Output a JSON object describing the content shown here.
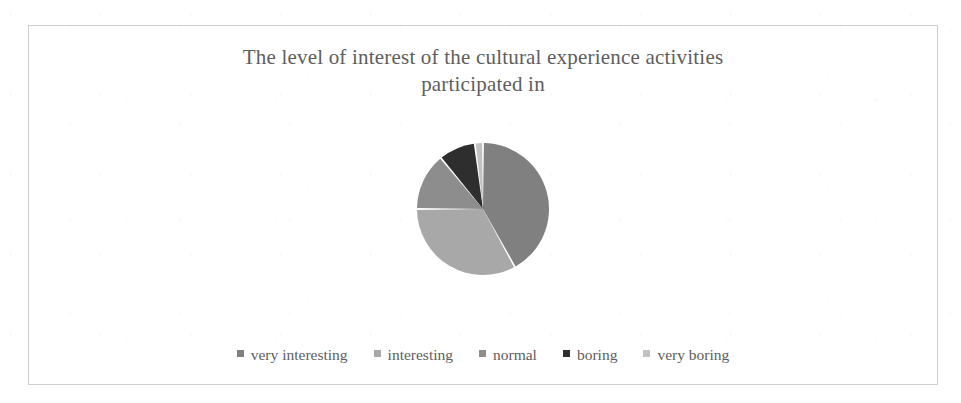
{
  "figure": {
    "title_line1": "The level of interest of the cultural experience activities",
    "title_line2": "participated in",
    "border_color": "#cfcfcf",
    "text_color": "#5e5e5e"
  },
  "legend": {
    "position": "bottom",
    "items": [
      {
        "label": "very interesting",
        "color": "#808080",
        "marker": "square-marker"
      },
      {
        "label": "interesting",
        "color": "#a8a8a8",
        "marker": "square-marker"
      },
      {
        "label": "normal",
        "color": "#8d8d8d",
        "marker": "square-marker"
      },
      {
        "label": "boring",
        "color": "#2e2e2e",
        "marker": "square-marker"
      },
      {
        "label": "very boring",
        "color": "#c2c2c2",
        "marker": "square-marker"
      }
    ]
  },
  "chart_data": {
    "type": "pie",
    "title": "The level of interest of the cultural experience activities participated in",
    "xlabel": "",
    "ylabel": "",
    "legend_position": "bottom",
    "grid": false,
    "start_angle_deg": 0,
    "direction": "clockwise",
    "categories": [
      "very interesting",
      "interesting",
      "normal",
      "boring",
      "very boring"
    ],
    "values": [
      42,
      33,
      14,
      9,
      2
    ],
    "units": "percent",
    "slices": [
      {
        "label": "very interesting",
        "value": 42,
        "color": "#808080",
        "start_deg": 44,
        "end_deg": 195
      },
      {
        "label": "interesting",
        "value": 33,
        "color": "#a8a8a8",
        "start_deg": 8,
        "end_deg": 127
      },
      {
        "label": "normal",
        "value": 14,
        "color": "#8d8d8d",
        "start_deg": 195,
        "end_deg": 245
      },
      {
        "label": "boring",
        "value": 9,
        "color": "#2e2e2e",
        "start_deg": 326,
        "end_deg": 358
      },
      {
        "label": "very boring",
        "value": 2,
        "color": "#c2c2c2",
        "start_deg": 0,
        "end_deg": 7
      }
    ]
  },
  "pie_geometry": {
    "center_x": 230,
    "center_y": 88,
    "radius": 66,
    "gap_color": "#ffffff",
    "gap_width": 3
  }
}
